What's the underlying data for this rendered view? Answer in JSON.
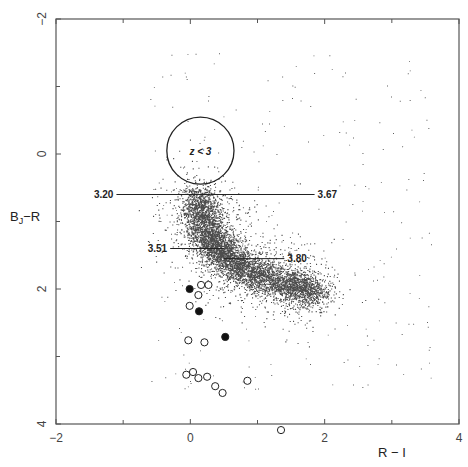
{
  "chart_data": {
    "type": "scatter",
    "title": "",
    "xlabel": "R − I",
    "ylabel": "B_J−R",
    "xlim": [
      -2,
      4
    ],
    "ylim": [
      -2,
      4
    ],
    "y_inverted": true,
    "grid": false,
    "x_ticks": [
      -2,
      0,
      2,
      4
    ],
    "x_minor_ticks": [
      -1,
      1,
      3
    ],
    "y_ticks": [
      -2,
      0,
      2,
      4
    ],
    "y_minor_ticks": [
      -1,
      1,
      3
    ],
    "x_tick_labels": [
      "−2",
      "0",
      "2",
      "4"
    ],
    "y_tick_labels": [
      "−2",
      "0",
      "2",
      "4"
    ],
    "background_cloud": {
      "description": "dense field of small black dots forming a curved stellar/galaxy locus",
      "locus_path": [
        [
          0.1,
          0.6
        ],
        [
          0.2,
          1.0
        ],
        [
          0.35,
          1.35
        ],
        [
          0.6,
          1.6
        ],
        [
          1.0,
          1.8
        ],
        [
          1.5,
          1.95
        ],
        [
          1.9,
          2.05
        ]
      ],
      "approx_points": 9000
    },
    "redshift_circle": {
      "center": [
        0.15,
        -0.05
      ],
      "radius_ri": 0.5,
      "label": "z < 3"
    },
    "redshift_tracks": [
      {
        "label": "3.20",
        "y": 0.6,
        "x_from": -1.1,
        "x_to": 0.3,
        "label_side": "left"
      },
      {
        "label": "3.67",
        "y": 0.6,
        "x_from": 0.3,
        "x_to": 1.85,
        "label_side": "right"
      },
      {
        "label": "3.51",
        "y": 1.4,
        "x_from": -0.3,
        "x_to": 0.5,
        "label_side": "left"
      },
      {
        "label": "3.80",
        "y": 1.55,
        "x_from": 0.5,
        "x_to": 1.4,
        "label_side": "right"
      }
    ],
    "series": [
      {
        "name": "open circles",
        "marker": "open-circle",
        "points": [
          [
            0.16,
            1.94
          ],
          [
            0.27,
            1.94
          ],
          [
            0.12,
            2.09
          ],
          [
            -0.01,
            2.25
          ],
          [
            -0.03,
            2.76
          ],
          [
            0.21,
            2.79
          ],
          [
            -0.06,
            3.27
          ],
          [
            0.04,
            3.23
          ],
          [
            0.12,
            3.32
          ],
          [
            0.25,
            3.3
          ],
          [
            0.37,
            3.44
          ],
          [
            0.48,
            3.54
          ],
          [
            0.85,
            3.36
          ],
          [
            1.35,
            4.09
          ]
        ]
      },
      {
        "name": "filled circles",
        "marker": "filled-circle",
        "points": [
          [
            -0.01,
            2.0
          ],
          [
            0.13,
            2.33
          ],
          [
            0.52,
            2.71
          ]
        ]
      }
    ]
  },
  "labels": {
    "x_axis_title": "R − I",
    "y_axis_main": "B",
    "y_axis_sub": "J",
    "y_axis_rest": "−R",
    "circle_label": "z < 3"
  }
}
